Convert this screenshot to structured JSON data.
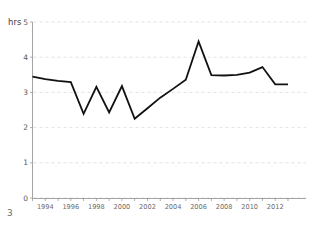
{
  "page": {
    "number": "3"
  },
  "chart_data": {
    "type": "line",
    "title": "",
    "subtitle": "",
    "xlabel": "",
    "ylabel": "hrs",
    "ylim": [
      0,
      5
    ],
    "xlim": [
      1993,
      2013
    ],
    "grid": true,
    "legend": null,
    "y_ticks": [
      "0",
      "1",
      "2",
      "3",
      "4",
      "5"
    ],
    "y_tick_values": [
      0,
      1,
      2,
      3,
      4,
      5
    ],
    "x_tick_values": [
      1993,
      1994,
      1995,
      1996,
      1997,
      1998,
      1999,
      2000,
      2001,
      2002,
      2003,
      2004,
      2005,
      2006,
      2007,
      2008,
      2009,
      2010,
      2011,
      2012,
      2013
    ],
    "x_tick_labels": [
      "",
      "1994",
      "",
      "1996",
      "",
      "1998",
      "",
      "2000",
      "",
      "2002",
      "",
      "2004",
      "",
      "2006",
      "",
      "2008",
      "",
      "2010",
      "",
      "2012",
      ""
    ],
    "x": [
      1993,
      1994,
      1995,
      1996,
      1997,
      1998,
      1999,
      2000,
      2001,
      2002,
      2003,
      2004,
      2005,
      2006,
      2007,
      2008,
      2009,
      2010,
      2011,
      2012,
      2013
    ],
    "values": [
      3.45,
      3.38,
      3.33,
      3.29,
      2.39,
      3.16,
      2.43,
      3.18,
      2.25,
      2.55,
      2.85,
      3.1,
      3.36,
      4.45,
      3.49,
      3.48,
      3.5,
      3.56,
      3.72,
      3.23,
      3.23
    ],
    "series": [
      {
        "name": "hrs",
        "color": "#111111",
        "values": [
          3.45,
          3.38,
          3.33,
          3.29,
          2.39,
          3.16,
          2.43,
          3.18,
          2.25,
          2.55,
          2.85,
          3.1,
          3.36,
          4.45,
          3.49,
          3.48,
          3.5,
          3.56,
          3.72,
          3.23,
          3.23
        ]
      }
    ],
    "colors": {
      "line": "#111111",
      "grid": "#d9d9e2",
      "axis": "#9a9a9a",
      "background": "#ffffff",
      "tick_label": "#6b6b6b"
    }
  }
}
